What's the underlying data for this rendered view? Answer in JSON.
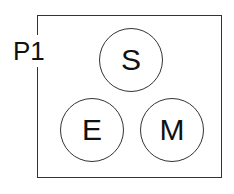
{
  "diagram": {
    "frame_label": "P1",
    "nodes": [
      {
        "id": "S",
        "label": "S"
      },
      {
        "id": "E",
        "label": "E"
      },
      {
        "id": "M",
        "label": "M"
      }
    ]
  }
}
